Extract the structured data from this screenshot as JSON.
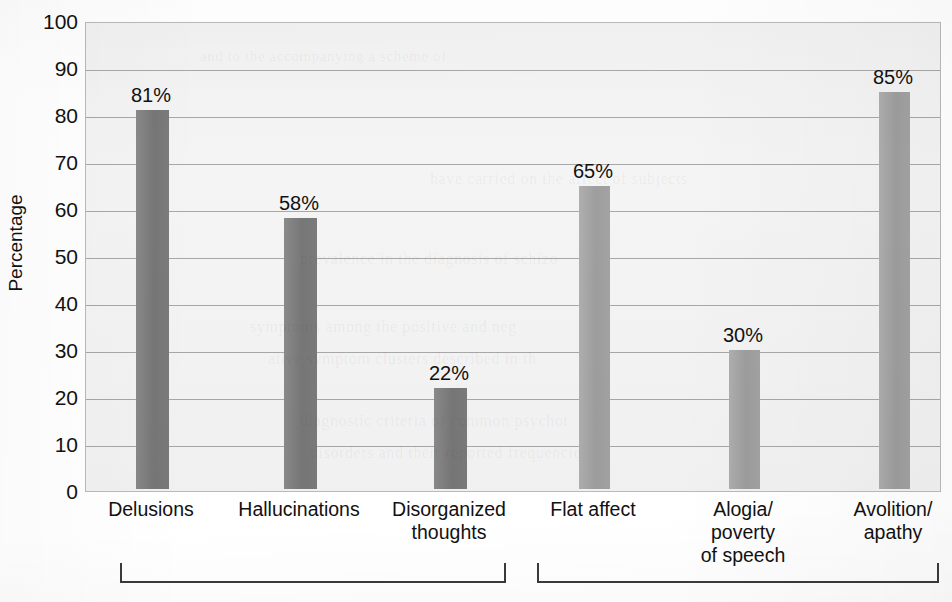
{
  "chart_data": {
    "type": "bar",
    "title": "",
    "xlabel": "",
    "ylabel": "Percentage",
    "ylim": [
      0,
      100
    ],
    "ytick_step": 10,
    "grid": true,
    "legend": "none",
    "categories": [
      "Delusions",
      "Hallucinations",
      "Disorganized\nthoughts",
      "Flat affect",
      "Alogia/\npoverty\nof speech",
      "Avolition/\napathy"
    ],
    "values": [
      81,
      58,
      22,
      65,
      30,
      85
    ],
    "value_labels": [
      "81%",
      "58%",
      "22%",
      "65%",
      "30%",
      "85%"
    ],
    "ytick_labels": [
      "100",
      "90",
      "80",
      "70",
      "60",
      "50",
      "40",
      "30",
      "20",
      "10",
      "0"
    ],
    "ytick_values": [
      100,
      90,
      80,
      70,
      60,
      50,
      40,
      30,
      20,
      10,
      0
    ],
    "bar_colors": [
      "#7d7d7d",
      "#7d7d7d",
      "#7d7d7d",
      "#a6a6a6",
      "#a6a6a6",
      "#a6a6a6"
    ],
    "groups": [
      {
        "name": "group-1",
        "category_indices": [
          0,
          1,
          2
        ],
        "color": "#7d7d7d"
      },
      {
        "name": "group-2",
        "category_indices": [
          3,
          4,
          5
        ],
        "color": "#a6a6a6"
      }
    ],
    "plot_background": "#f4f4f4",
    "gridline_color": "#9a9a9a",
    "axis_color": "#8d8d8d",
    "bracket_color": "#3a3a3a"
  },
  "ghost_text": [
    {
      "text": "and to the accompanying a scheme of",
      "x": 200,
      "y": 48,
      "size": 15
    },
    {
      "text": "have carried on the affect of subjects",
      "x": 430,
      "y": 170,
      "size": 16
    },
    {
      "text": "prevalence in the diagnosis of schizo",
      "x": 300,
      "y": 250,
      "size": 16
    },
    {
      "text": "symptoms among the positive and neg",
      "x": 250,
      "y": 318,
      "size": 16
    },
    {
      "text": "ative symptom clusters described in th",
      "x": 268,
      "y": 350,
      "size": 16
    },
    {
      "text": "diagnostic criteria of common psychot",
      "x": 300,
      "y": 412,
      "size": 16
    },
    {
      "text": "disorders and their reported frequencie",
      "x": 310,
      "y": 444,
      "size": 16
    }
  ]
}
